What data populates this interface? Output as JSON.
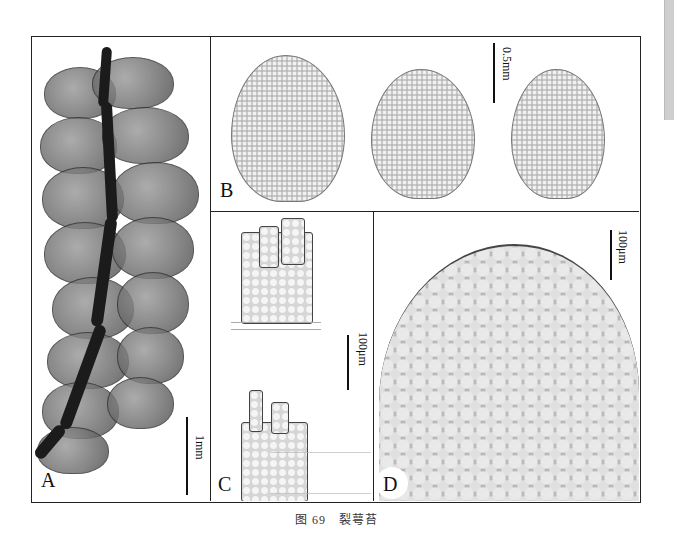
{
  "figure": {
    "caption": "图 69　裂萼苔",
    "panels": [
      {
        "id": "A",
        "label": "A",
        "scale_bar": "1mm",
        "description": "shoot with overlapping leaves"
      },
      {
        "id": "B",
        "label": "B",
        "scale_bar": "0.5mm",
        "description": "three leaves"
      },
      {
        "id": "C",
        "label": "C",
        "scale_bar": "100μm",
        "description": "perianth mouth cells"
      },
      {
        "id": "D",
        "label": "D",
        "scale_bar": "100μm",
        "description": "leaf cells detail"
      }
    ]
  },
  "colors": {
    "border": "#222222",
    "background": "#ffffff",
    "text": "#111111"
  }
}
